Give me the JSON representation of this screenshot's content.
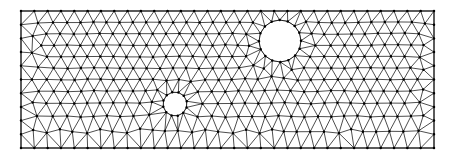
{
  "figure": {
    "canvas": {
      "width": 453,
      "height": 161
    },
    "background_color": "#ffffff"
  },
  "style": {
    "edge_color": "#000000",
    "edge_width": 0.7,
    "node_color": "#000000",
    "node_radius": 1.25,
    "boundary_color": "#000000",
    "boundary_width": 0.9,
    "hole_fill_color": "#ffffff",
    "show_nodes": true,
    "show_edges": true
  },
  "domain": {
    "type": "rectangle-with-circular-holes",
    "rectangle": {
      "x": 21,
      "y": 11,
      "width": 413,
      "height": 137
    },
    "holes": [
      {
        "name": "large-hole",
        "cx": 280,
        "cy": 41,
        "r": 21,
        "boundary_segments": 16
      },
      {
        "name": "small-hole",
        "cx": 175,
        "cy": 104,
        "r": 12,
        "boundary_segments": 12
      }
    ]
  },
  "mesh": {
    "element_type": "triangle",
    "nominal_edge_length": 13.2,
    "node_jitter": 0.3,
    "relax_iterations": 22,
    "random_seed": 20240517,
    "approx_node_count": 430,
    "approx_element_count": 800
  },
  "chart_data": {
    "type": "mesh",
    "xlabel": "",
    "ylabel": "",
    "xlim": [
      21,
      434
    ],
    "ylim": [
      11,
      148
    ],
    "grid": false,
    "legend": "none",
    "annotations": [],
    "series": [
      {
        "name": "domain-boundary",
        "kind": "polygon",
        "points": [
          [
            21,
            11
          ],
          [
            434,
            11
          ],
          [
            434,
            148
          ],
          [
            21,
            148
          ]
        ]
      },
      {
        "name": "large-hole-boundary",
        "kind": "circle",
        "center": [
          280,
          41
        ],
        "radius": 21
      },
      {
        "name": "small-hole-boundary",
        "kind": "circle",
        "center": [
          175,
          104
        ],
        "radius": 12
      }
    ]
  }
}
